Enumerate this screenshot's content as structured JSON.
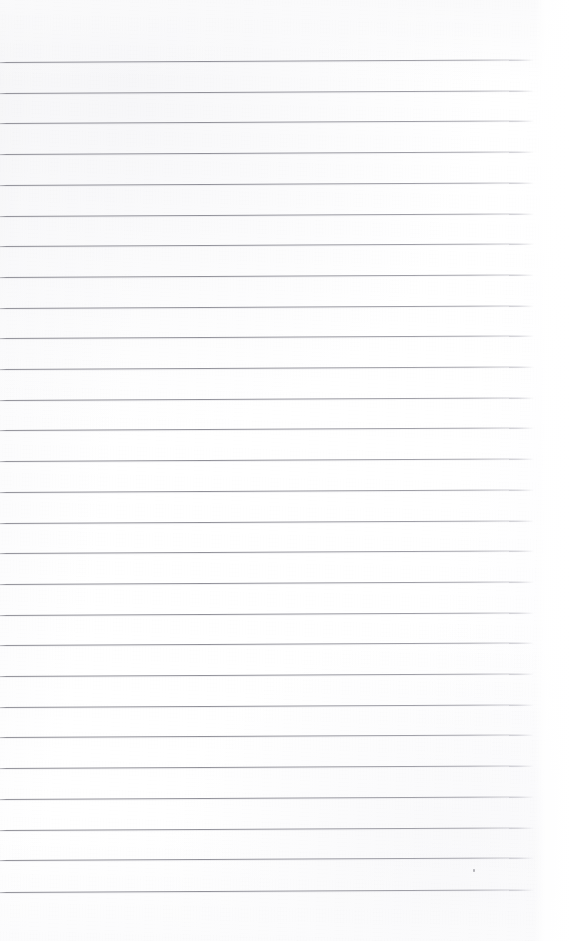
{
  "document": {
    "kind": "blank-ruled-notebook-page",
    "title": "Blank ruled notebook page",
    "description": "An empty sheet of lined paper with no handwriting or printed text",
    "width": 572,
    "height": 941,
    "content_text": "",
    "has_text": false
  },
  "paper": {
    "background_color": "#ffffff",
    "tint_color": "#f6f6f8",
    "edge_shade_color": "#f4f4f5"
  },
  "rules": {
    "line_color": "#9a9aa0",
    "line_shadow_color": "#cdcdd3",
    "line_thickness_px": 1,
    "count": 28,
    "first_line_y": 62,
    "spacing_px": 30.7,
    "left_x": 0,
    "right_x": 534,
    "tilt_px": -2.5,
    "positions": [
      62.0,
      92.7,
      123.4,
      154.1,
      184.8,
      215.5,
      246.2,
      276.9,
      307.6,
      338.3,
      369.0,
      399.7,
      430.4,
      461.1,
      491.8,
      522.5,
      553.2,
      583.9,
      614.6,
      645.3,
      676.0,
      706.7,
      737.4,
      768.1,
      798.8,
      829.5,
      860.2,
      892.0
    ]
  },
  "margins": {
    "top_blank_px": 62,
    "bottom_blank_px": 49,
    "right_blank_px": 38
  },
  "artifacts": [
    {
      "name": "speck",
      "x": 473,
      "y": 869
    }
  ]
}
